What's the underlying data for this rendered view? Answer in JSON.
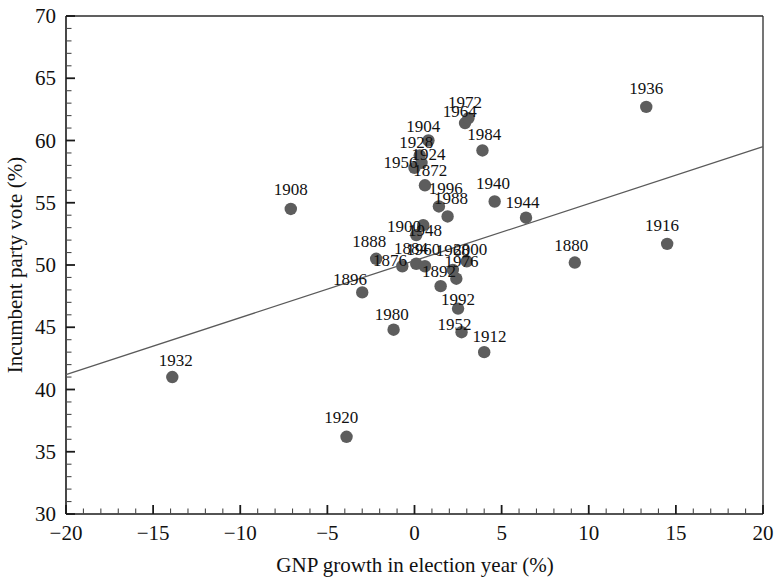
{
  "chart_data": {
    "type": "scatter",
    "title": "",
    "xlabel": "GNP growth in election year (%)",
    "ylabel": "Incumbent party vote (%)",
    "xlim": [
      -20,
      20
    ],
    "ylim": [
      30,
      70
    ],
    "x_major_ticks": [
      -20,
      -15,
      -10,
      -5,
      0,
      5,
      10,
      15,
      20
    ],
    "y_major_ticks": [
      30,
      35,
      40,
      45,
      50,
      55,
      60,
      65,
      70
    ],
    "x_tick_labels": [
      "-20",
      "-15",
      "-10",
      "-5",
      "0",
      "5",
      "10",
      "15",
      "20"
    ],
    "y_tick_labels": [
      "30",
      "35",
      "40",
      "45",
      "50",
      "55",
      "60",
      "65",
      "70"
    ],
    "x_minor_step": 1,
    "y_minor_step": 1,
    "grid": false,
    "legend": null,
    "point_color": "#5d5d5d",
    "line_color": "#5a5a5a",
    "fit_line": {
      "x0": -20,
      "y0": 41.2,
      "x1": 20,
      "y1": 59.5
    },
    "points": [
      {
        "label": "1872",
        "x": 0.6,
        "y": 56.4,
        "lx": 0.9,
        "ly": 57.6
      },
      {
        "label": "1876",
        "x": -0.7,
        "y": 49.9,
        "lx": -1.4,
        "ly": 50.4
      },
      {
        "label": "1880",
        "x": 9.2,
        "y": 50.2,
        "lx": 9.0,
        "ly": 51.6
      },
      {
        "label": "1884",
        "x": 0.1,
        "y": 50.1,
        "lx": -0.2,
        "ly": 51.4
      },
      {
        "label": "1888",
        "x": -2.2,
        "y": 50.5,
        "lx": -2.6,
        "ly": 51.9
      },
      {
        "label": "1892",
        "x": 1.5,
        "y": 48.3,
        "lx": 1.4,
        "ly": 49.5
      },
      {
        "label": "1896",
        "x": -3.0,
        "y": 47.8,
        "lx": -3.7,
        "ly": 48.9
      },
      {
        "label": "1900",
        "x": 0.5,
        "y": 53.2,
        "lx": -0.6,
        "ly": 53.1
      },
      {
        "label": "1904",
        "x": 0.8,
        "y": 60.0,
        "lx": 0.5,
        "ly": 61.2
      },
      {
        "label": "1908",
        "x": -7.1,
        "y": 54.5,
        "lx": -7.1,
        "ly": 56.1
      },
      {
        "label": "1912",
        "x": 4.0,
        "y": 43.0,
        "lx": 4.3,
        "ly": 44.3
      },
      {
        "label": "1916",
        "x": 14.5,
        "y": 51.7,
        "lx": 14.2,
        "ly": 53.2
      },
      {
        "label": "1920",
        "x": -3.9,
        "y": 36.2,
        "lx": -4.2,
        "ly": 37.8
      },
      {
        "label": "1924",
        "x": 0.4,
        "y": 58.2,
        "lx": 0.8,
        "ly": 58.9
      },
      {
        "label": "1928",
        "x": 0.3,
        "y": 58.8,
        "lx": 0.1,
        "ly": 59.9
      },
      {
        "label": "1932",
        "x": -13.9,
        "y": 41.0,
        "lx": -13.7,
        "ly": 42.4
      },
      {
        "label": "1936",
        "x": 13.3,
        "y": 62.7,
        "lx": 13.3,
        "ly": 64.2
      },
      {
        "label": "1940",
        "x": 4.6,
        "y": 55.1,
        "lx": 4.5,
        "ly": 56.6
      },
      {
        "label": "1944",
        "x": 6.4,
        "y": 53.8,
        "lx": 6.2,
        "ly": 55.1
      },
      {
        "label": "1948",
        "x": 0.1,
        "y": 52.4,
        "lx": 0.6,
        "ly": 52.8
      },
      {
        "label": "1952",
        "x": 2.7,
        "y": 44.6,
        "lx": 2.3,
        "ly": 45.3
      },
      {
        "label": "1956",
        "x": 0.0,
        "y": 57.8,
        "lx": -0.8,
        "ly": 58.3
      },
      {
        "label": "1960",
        "x": 0.6,
        "y": 49.9,
        "lx": 0.5,
        "ly": 51.3
      },
      {
        "label": "1964",
        "x": 2.9,
        "y": 61.4,
        "lx": 2.6,
        "ly": 62.4
      },
      {
        "label": "1968",
        "x": 2.2,
        "y": 49.6,
        "lx": 2.2,
        "ly": 51.2
      },
      {
        "label": "1972",
        "x": 3.1,
        "y": 61.8,
        "lx": 2.9,
        "ly": 63.1
      },
      {
        "label": "1976",
        "x": 2.4,
        "y": 48.9,
        "lx": 2.7,
        "ly": 50.3
      },
      {
        "label": "1980",
        "x": -1.2,
        "y": 44.8,
        "lx": -1.3,
        "ly": 46.1
      },
      {
        "label": "1984",
        "x": 3.9,
        "y": 59.2,
        "lx": 4.0,
        "ly": 60.5
      },
      {
        "label": "1988",
        "x": 1.9,
        "y": 53.9,
        "lx": 2.1,
        "ly": 55.4
      },
      {
        "label": "1992",
        "x": 2.5,
        "y": 46.5,
        "lx": 2.5,
        "ly": 47.3
      },
      {
        "label": "1996",
        "x": 1.4,
        "y": 54.7,
        "lx": 1.8,
        "ly": 56.2
      },
      {
        "label": "2000",
        "x": 3.0,
        "y": 50.3,
        "lx": 3.2,
        "ly": 51.3
      }
    ]
  }
}
